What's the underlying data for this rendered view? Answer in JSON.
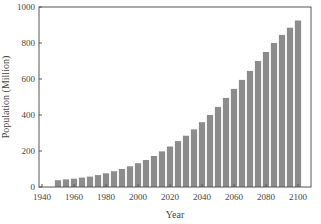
{
  "chart_data": {
    "type": "bar",
    "title": "",
    "xlabel": "Year",
    "ylabel": "Population (Million)",
    "xlim": [
      1940,
      2105
    ],
    "ylim": [
      0,
      1000
    ],
    "xticks": [
      1940,
      1960,
      1980,
      2000,
      2020,
      2040,
      2060,
      2080,
      2100
    ],
    "yticks": [
      0,
      200,
      400,
      600,
      800,
      1000
    ],
    "grid": false,
    "legend": null,
    "bar_color": "#8c8c8c",
    "categories": [
      1950,
      1955,
      1960,
      1965,
      1970,
      1975,
      1980,
      1985,
      1990,
      1995,
      2000,
      2005,
      2010,
      2015,
      2020,
      2025,
      2030,
      2035,
      2040,
      2045,
      2050,
      2055,
      2060,
      2065,
      2070,
      2075,
      2080,
      2085,
      2090,
      2095,
      2100
    ],
    "values": [
      38,
      42,
      46,
      52,
      58,
      66,
      76,
      88,
      100,
      115,
      132,
      150,
      172,
      198,
      225,
      255,
      285,
      320,
      360,
      400,
      445,
      495,
      545,
      595,
      645,
      700,
      750,
      800,
      845,
      885,
      925
    ]
  }
}
